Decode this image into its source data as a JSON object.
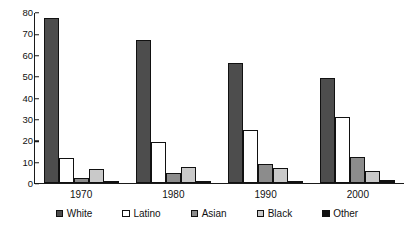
{
  "chart_data": {
    "type": "bar",
    "title": "",
    "subtitle": "",
    "xlabel": "",
    "ylabel": "Percent",
    "categories": [
      "1970",
      "1980",
      "1990",
      "2000"
    ],
    "ylim": [
      0,
      80
    ],
    "yticks": [
      0,
      10,
      20,
      30,
      40,
      50,
      60,
      70,
      80
    ],
    "ytick_labels": [
      "0",
      "10",
      "20",
      "30",
      "40",
      "50",
      "60",
      "70",
      "80"
    ],
    "grid": false,
    "legend_position": "bottom",
    "series": [
      {
        "name": "White",
        "color": "#4d4d4d",
        "values": [
          77,
          67,
          56,
          49
        ]
      },
      {
        "name": "Latino",
        "color": "#ffffff",
        "values": [
          11.5,
          19,
          25,
          31
        ]
      },
      {
        "name": "Asian",
        "color": "#8c8c8c",
        "values": [
          2.5,
          4.5,
          9,
          12
        ]
      },
      {
        "name": "Black",
        "color": "#c9c9c9",
        "values": [
          6.5,
          7.5,
          7,
          5.5
        ]
      },
      {
        "name": "Other",
        "color": "#111111",
        "values": [
          0.7,
          0.8,
          1,
          1.2
        ]
      }
    ]
  }
}
